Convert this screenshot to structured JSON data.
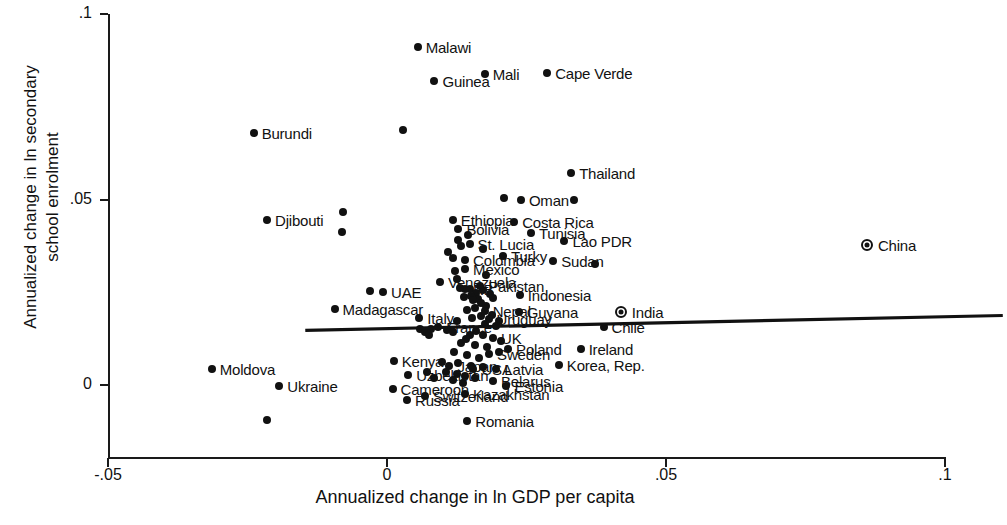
{
  "chart_data": {
    "type": "scatter",
    "title": "",
    "xlabel": "Annualized change in ln GDP per capita",
    "ylabel_line1": "Annualized change in ln secondary",
    "ylabel_line2": "school enrolment",
    "xlim": [
      -0.05,
      0.1
    ],
    "ylim": [
      -0.015,
      0.1
    ],
    "xticks": [
      "-.05",
      "0",
      ".05",
      ".1"
    ],
    "xtick_values": [
      -0.05,
      0,
      0.05,
      0.1
    ],
    "yticks": [
      ".1",
      ".05",
      "0"
    ],
    "ytick_values": [
      0.1,
      0.05,
      0.0
    ],
    "grid": false,
    "legend": "none",
    "fit_line": {
      "x_start": -0.034,
      "y_start": 0.0185,
      "x_end": 0.091,
      "y_end": 0.0225,
      "note": "nearly flat positive-slope regression line"
    },
    "points": [
      {
        "label": "Malawi",
        "x": 0.0055,
        "y": 0.091,
        "lx": "right",
        "marker": "dot"
      },
      {
        "label": "Guinea",
        "x": 0.0085,
        "y": 0.082,
        "lx": "right",
        "marker": "dot"
      },
      {
        "label": "Mali",
        "x": 0.0175,
        "y": 0.0838,
        "lx": "right",
        "marker": "dot"
      },
      {
        "label": "Cape Verde",
        "x": 0.0287,
        "y": 0.084,
        "lx": "right",
        "marker": "dot"
      },
      {
        "label": "Burundi",
        "x": -0.0239,
        "y": 0.0678,
        "lx": "right",
        "marker": "dot"
      },
      {
        "label": "",
        "x": 0.0028,
        "y": 0.0686,
        "lx": "right",
        "marker": "dot"
      },
      {
        "label": "Thailand",
        "x": 0.033,
        "y": 0.0572,
        "lx": "right",
        "marker": "dot"
      },
      {
        "label": "Djibouti",
        "x": -0.0215,
        "y": 0.0445,
        "lx": "right",
        "marker": "dot"
      },
      {
        "label": "",
        "x": -0.0078,
        "y": 0.0465,
        "lx": "right",
        "marker": "dot"
      },
      {
        "label": "",
        "x": -0.008,
        "y": 0.0413,
        "lx": "right",
        "marker": "dot"
      },
      {
        "label": "Oman",
        "x": 0.024,
        "y": 0.0498,
        "lx": "right",
        "marker": "dot"
      },
      {
        "label": "",
        "x": 0.021,
        "y": 0.0505,
        "lx": "right",
        "marker": "dot"
      },
      {
        "label": "",
        "x": 0.0335,
        "y": 0.05,
        "lx": "right",
        "marker": "dot"
      },
      {
        "label": "Ethiopia",
        "x": 0.0118,
        "y": 0.0444,
        "lx": "right",
        "marker": "dot"
      },
      {
        "label": "Costa Rica",
        "x": 0.0228,
        "y": 0.044,
        "lx": "right",
        "marker": "dot"
      },
      {
        "label": "Bolivia",
        "x": 0.0128,
        "y": 0.042,
        "lx": "right",
        "marker": "dot"
      },
      {
        "label": "Tunisia",
        "x": 0.0258,
        "y": 0.041,
        "lx": "right",
        "marker": "dot"
      },
      {
        "label": "",
        "x": 0.0145,
        "y": 0.0404,
        "lx": "right",
        "marker": "dot"
      },
      {
        "label": "Lao PDR",
        "x": 0.0318,
        "y": 0.0388,
        "lx": "right",
        "marker": "dot"
      },
      {
        "label": "St. Lucia",
        "x": 0.0148,
        "y": 0.038,
        "lx": "right",
        "marker": "dot"
      },
      {
        "label": "",
        "x": 0.0133,
        "y": 0.0374,
        "lx": "right",
        "marker": "dot"
      },
      {
        "label": "",
        "x": 0.0172,
        "y": 0.0367,
        "lx": "right",
        "marker": "dot"
      },
      {
        "label": "Turky",
        "x": 0.0208,
        "y": 0.0348,
        "lx": "right",
        "marker": "dot"
      },
      {
        "label": "Colombia",
        "x": 0.014,
        "y": 0.0338,
        "lx": "right",
        "marker": "dot"
      },
      {
        "label": "",
        "x": 0.0118,
        "y": 0.0342,
        "lx": "right",
        "marker": "dot"
      },
      {
        "label": "Sudan",
        "x": 0.0298,
        "y": 0.0335,
        "lx": "right",
        "marker": "dot"
      },
      {
        "label": "",
        "x": 0.0372,
        "y": 0.0326,
        "lx": "right",
        "marker": "dot"
      },
      {
        "label": "Mexico",
        "x": 0.014,
        "y": 0.0312,
        "lx": "right",
        "marker": "dot"
      },
      {
        "label": "",
        "x": 0.0122,
        "y": 0.0308,
        "lx": "right",
        "marker": "dot"
      },
      {
        "label": "Venezuela",
        "x": 0.0095,
        "y": 0.0278,
        "lx": "right",
        "marker": "dot"
      },
      {
        "label": "Pakistan",
        "x": 0.0167,
        "y": 0.0268,
        "lx": "right",
        "marker": "dot"
      },
      {
        "label": "RB",
        "x": 0.014,
        "y": 0.0258,
        "lx": "right",
        "marker": "dot"
      },
      {
        "label": "UAE",
        "x": -0.0007,
        "y": 0.025,
        "lx": "right",
        "marker": "dot"
      },
      {
        "label": "",
        "x": -0.003,
        "y": 0.0253,
        "lx": "right",
        "marker": "dot"
      },
      {
        "label": "Indonesia",
        "x": 0.0238,
        "y": 0.0243,
        "lx": "right",
        "marker": "dot"
      },
      {
        "label": "",
        "x": 0.019,
        "y": 0.0235,
        "lx": "right",
        "marker": "dot"
      },
      {
        "label": "",
        "x": 0.0155,
        "y": 0.0228,
        "lx": "right",
        "marker": "dot"
      },
      {
        "label": "",
        "x": 0.0168,
        "y": 0.0222,
        "lx": "right",
        "marker": "dot"
      },
      {
        "label": "Madagascar",
        "x": -0.0094,
        "y": 0.0204,
        "lx": "right",
        "marker": "dot"
      },
      {
        "label": "Nepal",
        "x": 0.0175,
        "y": 0.02,
        "lx": "right",
        "marker": "dot"
      },
      {
        "label": "Guyana",
        "x": 0.0236,
        "y": 0.0197,
        "lx": "right",
        "marker": "dot"
      },
      {
        "label": "India",
        "x": 0.0419,
        "y": 0.0197,
        "lx": "right",
        "marker": "ring"
      },
      {
        "label": "Uruguay",
        "x": 0.0182,
        "y": 0.0178,
        "lx": "right",
        "marker": "dot"
      },
      {
        "label": "Italy",
        "x": 0.0058,
        "y": 0.018,
        "lx": "right",
        "marker": "dot"
      },
      {
        "label": "Chile",
        "x": 0.0388,
        "y": 0.0155,
        "lx": "right",
        "marker": "dot"
      },
      {
        "label": "France",
        "x": 0.0092,
        "y": 0.0155,
        "lx": "right",
        "marker": "dot"
      },
      {
        "label": "",
        "x": 0.0078,
        "y": 0.015,
        "lx": "right",
        "marker": "dot"
      },
      {
        "label": "",
        "x": 0.0195,
        "y": 0.016,
        "lx": "right",
        "marker": "dot"
      },
      {
        "label": "UK",
        "x": 0.019,
        "y": 0.0128,
        "lx": "right",
        "marker": "dot"
      },
      {
        "label": "",
        "x": 0.0142,
        "y": 0.0125,
        "lx": "right",
        "marker": "dot"
      },
      {
        "label": "",
        "x": 0.0205,
        "y": 0.0118,
        "lx": "right",
        "marker": "dot"
      },
      {
        "label": "Ireland",
        "x": 0.0347,
        "y": 0.0096,
        "lx": "right",
        "marker": "dot"
      },
      {
        "label": "Poland",
        "x": 0.0217,
        "y": 0.0098,
        "lx": "right",
        "marker": "dot"
      },
      {
        "label": "Sweden",
        "x": 0.0183,
        "y": 0.0083,
        "lx": "right",
        "marker": "dot"
      },
      {
        "label": "Korea, Rep.",
        "x": 0.0308,
        "y": 0.0054,
        "lx": "right",
        "marker": "dot"
      },
      {
        "label": "Kenya",
        "x": 0.0012,
        "y": 0.0066,
        "lx": "right",
        "marker": "dot"
      },
      {
        "label": "Japan",
        "x": 0.0112,
        "y": 0.005,
        "lx": "right",
        "marker": "dot"
      },
      {
        "label": "USA",
        "x": 0.0155,
        "y": 0.0043,
        "lx": "right",
        "marker": "dot"
      },
      {
        "label": "Latvia",
        "x": 0.0196,
        "y": 0.0043,
        "lx": "right",
        "marker": "dot"
      },
      {
        "label": "Uzbekistan",
        "x": 0.0038,
        "y": 0.0027,
        "lx": "right",
        "marker": "dot"
      },
      {
        "label": "Moldova",
        "x": -0.0314,
        "y": 0.0044,
        "lx": "right",
        "marker": "dot"
      },
      {
        "label": "Belarus",
        "x": 0.019,
        "y": 0.0012,
        "lx": "right",
        "marker": "dot"
      },
      {
        "label": "Estonia",
        "x": 0.0214,
        "y": -0.0002,
        "lx": "right",
        "marker": "dot"
      },
      {
        "label": "Ukraine",
        "x": -0.0193,
        "y": -0.0003,
        "lx": "right",
        "marker": "dot"
      },
      {
        "label": "Cameroon",
        "x": 0.001,
        "y": -0.001,
        "lx": "right",
        "marker": "dot"
      },
      {
        "label": "Kazakhstan",
        "x": 0.014,
        "y": -0.0025,
        "lx": "right",
        "marker": "dot"
      },
      {
        "label": "Switzerland",
        "x": 0.0068,
        "y": -0.003,
        "lx": "right",
        "marker": "dot"
      },
      {
        "label": "Russia",
        "x": 0.0036,
        "y": -0.004,
        "lx": "right",
        "marker": "dot"
      },
      {
        "label": "Romania",
        "x": 0.0144,
        "y": -0.0098,
        "lx": "right",
        "marker": "dot"
      },
      {
        "label": "",
        "x": -0.0215,
        "y": -0.0095,
        "lx": "right",
        "marker": "dot"
      },
      {
        "label": "China",
        "x": 0.086,
        "y": 0.0378,
        "lx": "right",
        "marker": "ring"
      }
    ],
    "cluster_points": [
      {
        "x": 0.013,
        "y": 0.0262
      },
      {
        "x": 0.0148,
        "y": 0.0258
      },
      {
        "x": 0.016,
        "y": 0.0249
      },
      {
        "x": 0.0172,
        "y": 0.0255
      },
      {
        "x": 0.0185,
        "y": 0.0245
      },
      {
        "x": 0.015,
        "y": 0.024
      },
      {
        "x": 0.0138,
        "y": 0.0236
      },
      {
        "x": 0.0163,
        "y": 0.0232
      },
      {
        "x": 0.0178,
        "y": 0.0214
      },
      {
        "x": 0.0158,
        "y": 0.0208
      },
      {
        "x": 0.0143,
        "y": 0.0202
      },
      {
        "x": 0.0188,
        "y": 0.019
      },
      {
        "x": 0.0168,
        "y": 0.0186
      },
      {
        "x": 0.0152,
        "y": 0.018
      },
      {
        "x": 0.0126,
        "y": 0.0172
      },
      {
        "x": 0.02,
        "y": 0.0172
      },
      {
        "x": 0.0175,
        "y": 0.0164
      },
      {
        "x": 0.0108,
        "y": 0.0148
      },
      {
        "x": 0.0119,
        "y": 0.0142
      },
      {
        "x": 0.016,
        "y": 0.0146
      },
      {
        "x": 0.0148,
        "y": 0.0136
      },
      {
        "x": 0.0172,
        "y": 0.0134
      },
      {
        "x": 0.0133,
        "y": 0.0112
      },
      {
        "x": 0.0158,
        "y": 0.0108
      },
      {
        "x": 0.018,
        "y": 0.0102
      },
      {
        "x": 0.02,
        "y": 0.0088
      },
      {
        "x": 0.012,
        "y": 0.009
      },
      {
        "x": 0.0143,
        "y": 0.008
      },
      {
        "x": 0.0165,
        "y": 0.0074
      },
      {
        "x": 0.0098,
        "y": 0.0062
      },
      {
        "x": 0.0128,
        "y": 0.0058
      },
      {
        "x": 0.015,
        "y": 0.0052
      },
      {
        "x": 0.0172,
        "y": 0.0048
      },
      {
        "x": 0.0105,
        "y": 0.0034
      },
      {
        "x": 0.0126,
        "y": 0.003
      },
      {
        "x": 0.014,
        "y": 0.0024
      },
      {
        "x": 0.0158,
        "y": 0.002
      },
      {
        "x": 0.0118,
        "y": 0.0014
      },
      {
        "x": 0.0136,
        "y": 0.0006
      },
      {
        "x": 0.0072,
        "y": 0.0035
      },
      {
        "x": 0.0085,
        "y": 0.002
      },
      {
        "x": 0.006,
        "y": 0.015
      },
      {
        "x": 0.0068,
        "y": 0.0142
      },
      {
        "x": 0.0076,
        "y": 0.0136
      },
      {
        "x": 0.0178,
        "y": 0.0296
      },
      {
        "x": 0.0125,
        "y": 0.0286
      },
      {
        "x": 0.011,
        "y": 0.0358
      },
      {
        "x": 0.0128,
        "y": 0.0392
      }
    ]
  }
}
